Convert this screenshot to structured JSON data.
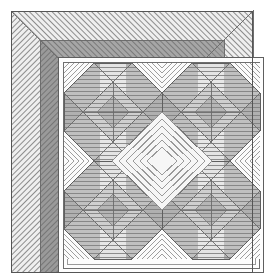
{
  "figure": {
    "name": "quilt-pattern-diagram",
    "title": "Quilt block pattern with mitered double border",
    "width": 264,
    "height": 273,
    "background_color": "#ffffff",
    "style": "grayscale line-art / hatched rendering"
  },
  "palette": {
    "background": "#ffffff",
    "outline": "#6e6e6e",
    "outline_dark": "#555555",
    "hatch_line": "#8d8d8d",
    "border_outer_fill": "#efefef",
    "border_inner_fill": "#a6a6a6",
    "border_inner_fill_dark": "#9a9a9a",
    "panel_fill": "#fdfdfd",
    "star_point_mid": "#b4b4b4",
    "star_point_dark": "#9c9c9c",
    "star_center_light": "#dcdcdc",
    "setting_square_fill": "#f4f4f4",
    "corner_light": "#e8e8e8"
  },
  "layout": {
    "margin": {
      "left": 11,
      "top": 11,
      "right": 11,
      "bottom": 11
    },
    "frame": {
      "x": 11,
      "y": 11,
      "width": 242,
      "height": 262
    },
    "border_outer_band_width": 29,
    "border_inner_band_width": 18,
    "inner_frame_line_inset": 6,
    "panel": {
      "x": 58,
      "y": 57,
      "width": 206,
      "height": 216
    },
    "block_grid": {
      "columns": 2,
      "rows": 2,
      "block_size": 98
    }
  },
  "regions": [
    {
      "name": "outer-border-band",
      "label": "Outer border band",
      "fill": "#efefef",
      "hatch": "diagonal-45",
      "hatch_spacing": 4,
      "mitered_corners": true
    },
    {
      "name": "inner-border-band",
      "label": "Inner border band",
      "fill": "#a6a6a6",
      "hatch": "diagonal-45",
      "hatch_spacing": 4,
      "mitered_corners": true
    },
    {
      "name": "inner-frame-outline",
      "label": "Thin inner frame outline",
      "stroke": "#6e6e6e",
      "stroke_width": 1
    },
    {
      "name": "center-panel",
      "label": "Center pieced panel",
      "fill": "#fdfdfd"
    }
  ],
  "blocks": [
    {
      "name": "star-block-top-left",
      "row": 0,
      "col": 0,
      "motif": "eight-point-star-octagon"
    },
    {
      "name": "star-block-top-right",
      "row": 0,
      "col": 1,
      "motif": "eight-point-star-octagon"
    },
    {
      "name": "star-block-bottom-left",
      "row": 1,
      "col": 0,
      "motif": "eight-point-star-octagon"
    },
    {
      "name": "star-block-bottom-right",
      "row": 1,
      "col": 1,
      "motif": "eight-point-star-octagon"
    }
  ],
  "motif_detail": {
    "name": "eight-point-star-octagon",
    "description": "Octagonal medallion with four dark corner wedges, vertical central column of light bands, and horizontal quilting lines",
    "quilting": {
      "center": "horizontal-lines",
      "center_spacing": 4,
      "setting_square": "concentric-diagonal",
      "setting_spacing": 5
    },
    "octagon_fill": "#dcdcdc",
    "wedge_fill": "#b4b4b4",
    "wedge_fill_dark": "#9c9c9c"
  },
  "setting_squares": [
    {
      "name": "setting-square-center",
      "quilting": "concentric-diagonal",
      "fill": "#f4f4f4"
    },
    {
      "name": "setting-square-edge",
      "quilting": "concentric-diagonal",
      "fill": "#f4f4f4"
    }
  ]
}
